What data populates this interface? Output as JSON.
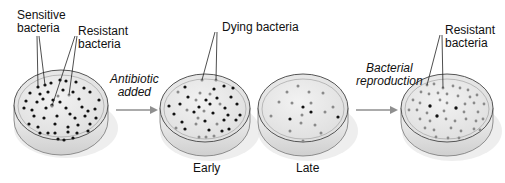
{
  "labels": {
    "sensitive": [
      "Sensitive",
      "bacteria"
    ],
    "resistant_left": [
      "Resistant",
      "bacteria"
    ],
    "antibiotic": [
      "Antibiotic",
      "added"
    ],
    "dying": "Dying bacteria",
    "reproduction": [
      "Bacterial",
      "reproduction"
    ],
    "resistant_right": [
      "Resistant",
      "bacteria"
    ],
    "early": "Early",
    "late": "Late"
  },
  "colors": {
    "sensitive_dot": "#111111",
    "resistant_dot": "#8a8a8a",
    "dish_fill": "#e9e9e9",
    "arrow": "#8f8f8f"
  },
  "dishes": [
    {
      "id": "initial",
      "cx": 61,
      "cy": 105
    },
    {
      "id": "early",
      "cx": 205,
      "cy": 108
    },
    {
      "id": "late",
      "cx": 303,
      "cy": 108
    },
    {
      "id": "reproduced",
      "cx": 447,
      "cy": 108
    }
  ]
}
